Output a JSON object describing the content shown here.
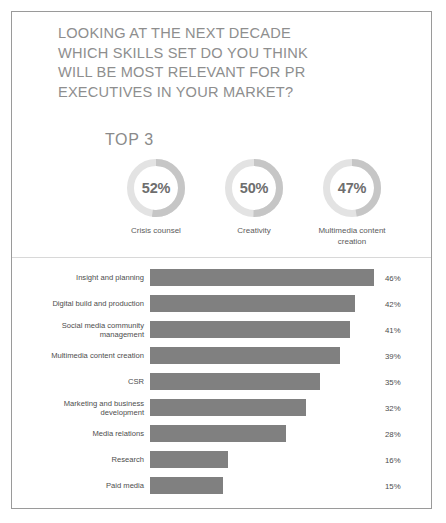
{
  "colors": {
    "frame_border": "#9a9a9a",
    "title_text": "#8e8e8e",
    "bar_fill": "#808080",
    "donut_track": "#e3e3e3",
    "donut_arc": "#c6c6c6",
    "label_text": "#4d4d4d",
    "divider": "#d8d8d8"
  },
  "title": {
    "lines": [
      "LOOKING AT THE NEXT DECADE",
      "WHICH SKILLS SET DO YOU THINK",
      "WILL BE MOST RELEVANT FOR PR",
      "EXECUTIVES IN YOUR MARKET?"
    ]
  },
  "top3": {
    "heading": "TOP 3"
  },
  "chart_data": [
    {
      "type": "pie",
      "title": "TOP 3",
      "subtype": "donut-gauge-set",
      "legend": "below-each",
      "slices": [
        {
          "label": "Crisis counsel",
          "value": 52,
          "display": "52%"
        },
        {
          "label": "Creativity",
          "value": 50,
          "display": "50%"
        },
        {
          "label": "Multimedia content creation",
          "value": 47,
          "display": "47%"
        }
      ]
    },
    {
      "type": "bar",
      "orientation": "horizontal",
      "title": "",
      "xlabel": "",
      "ylabel": "",
      "xlim": [
        0,
        50
      ],
      "grid": false,
      "legend": null,
      "categories": [
        "Insight and planning",
        "Digital build and production",
        "Social media community management",
        "Multimedia content creation",
        "CSR",
        "Marketing and business development",
        "Media relations",
        "Research",
        "Paid media"
      ],
      "values": [
        46,
        42,
        41,
        39,
        35,
        32,
        28,
        16,
        15
      ],
      "value_labels": [
        "46%",
        "42%",
        "41%",
        "39%",
        "35%",
        "32%",
        "28%",
        "16%",
        "15%"
      ]
    }
  ]
}
